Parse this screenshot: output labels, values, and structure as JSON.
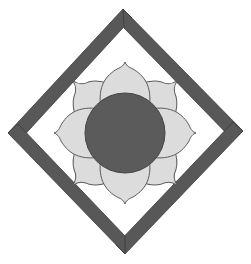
{
  "figure": {
    "colors": {
      "background": "#ffffff",
      "frame": "#585858",
      "petal_fill": "#dcdcdc",
      "petal_outline": "#5a5a5a",
      "center_fill": "#5b5b5b"
    },
    "frame": {
      "shape": "diamond",
      "bars": 4
    },
    "flower": {
      "petals": 8,
      "center": "circle"
    }
  }
}
